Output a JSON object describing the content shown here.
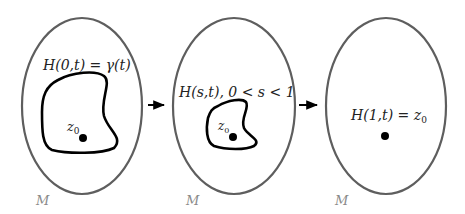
{
  "diagram": {
    "colors": {
      "manifold_stroke": "#5e5e5e",
      "loop_stroke": "#000000",
      "text": "#222222",
      "manifold_label": "#8a8a8a",
      "background": "#ffffff"
    },
    "panels": [
      {
        "id": "start",
        "label": "H(0,t) = γ(t)",
        "label_parts": {
          "pre": "H(0,",
          "t": "t",
          "post": ") = γ(",
          "t2": "t",
          "end": ")"
        },
        "point_label": "z",
        "point_sub": "0",
        "manifold_label": "M",
        "has_loop": true
      },
      {
        "id": "intermediate",
        "label": "H(s,t), 0 < s < 1",
        "point_label": "z",
        "point_sub": "0",
        "manifold_label": "M",
        "has_loop": true
      },
      {
        "id": "end",
        "label": "H(1,t) = z0",
        "label_main": "H(1,t) = z",
        "label_sub": "0",
        "manifold_label": "M",
        "has_loop": false
      }
    ],
    "arrows": [
      {
        "from": "start",
        "to": "intermediate",
        "icon": "right-arrow-icon"
      },
      {
        "from": "intermediate",
        "to": "end",
        "icon": "right-arrow-icon"
      }
    ]
  }
}
